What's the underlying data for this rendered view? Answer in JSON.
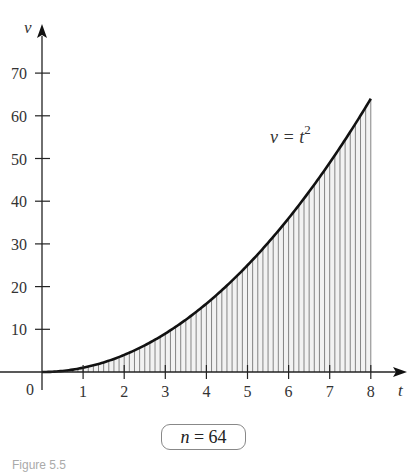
{
  "chart_data": {
    "type": "area",
    "title": "",
    "function_label": "v = t²",
    "xlabel": "t",
    "ylabel": "v",
    "x_ticks": [
      0,
      1,
      2,
      3,
      4,
      5,
      6,
      7,
      8
    ],
    "y_ticks": [
      10,
      20,
      30,
      40,
      50,
      60,
      70
    ],
    "xlim": [
      0,
      8
    ],
    "ylim": [
      0,
      75
    ],
    "n_rectangles": 64,
    "interval": [
      0,
      8
    ],
    "series": [
      {
        "name": "v = t^2",
        "x": [
          0,
          1,
          2,
          3,
          4,
          5,
          6,
          7,
          8
        ],
        "values": [
          0,
          1,
          4,
          9,
          16,
          25,
          36,
          49,
          64
        ]
      }
    ],
    "grid": false,
    "shading": "vertical hatch lines under the curve (Riemann rectangles)"
  },
  "labels": {
    "y_axis": "v",
    "x_axis": "t",
    "origin": "0",
    "curve_label_lhs": "v = t",
    "curve_label_exp": "2",
    "badge_var": "n",
    "badge_rest": " = 64",
    "caption": "Figure 5.5"
  }
}
